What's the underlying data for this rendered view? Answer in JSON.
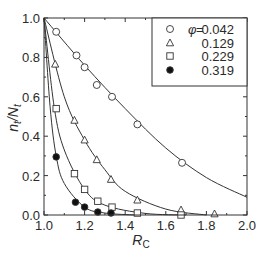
{
  "chart_data": {
    "type": "scatter",
    "title": "",
    "xlabel": "R_C",
    "xlabel_main": "R",
    "xlabel_sub": "C",
    "ylabel": "n_t/N_t",
    "ylabel_n": "n",
    "ylabel_sub1": "t",
    "ylabel_slash": "/N",
    "ylabel_sub2": "t",
    "xlim": [
      1.0,
      2.0
    ],
    "ylim": [
      0.0,
      1.0
    ],
    "x_ticks": [
      "1.0",
      "1.2",
      "1.4",
      "1.6",
      "1.8",
      "2.0"
    ],
    "x_tick_values": [
      1.0,
      1.2,
      1.4,
      1.6,
      1.8,
      2.0
    ],
    "y_ticks": [
      "0.0",
      "0.2",
      "0.4",
      "0.6",
      "0.8",
      "1.0"
    ],
    "y_tick_values": [
      0.0,
      0.2,
      0.4,
      0.6,
      0.8,
      1.0
    ],
    "grid": false,
    "legend_position": "upper right",
    "legend_symbol": "φ",
    "legend_equals": "=",
    "series": [
      {
        "name": "0.042",
        "label": "0.042",
        "marker": "open-circle",
        "x": [
          1.06,
          1.16,
          1.2,
          1.26,
          1.335,
          1.46,
          1.68
        ],
        "y": [
          0.93,
          0.81,
          0.75,
          0.66,
          0.6,
          0.46,
          0.265
        ],
        "fit_curve": {
          "x": [
            1.0,
            1.2,
            1.4,
            1.6,
            1.8,
            2.0
          ],
          "y": [
            1.0,
            0.76,
            0.54,
            0.34,
            0.19,
            0.09
          ]
        }
      },
      {
        "name": "0.129",
        "label": "0.129",
        "marker": "open-triangle",
        "x": [
          1.055,
          1.15,
          1.2,
          1.26,
          1.33,
          1.46,
          1.675,
          1.84
        ],
        "y": [
          0.765,
          0.48,
          0.38,
          0.28,
          0.18,
          0.075,
          0.025,
          0.005
        ],
        "fit_curve": {
          "x": [
            1.0,
            1.1,
            1.2,
            1.3,
            1.4,
            1.6,
            1.8
          ],
          "y": [
            1.0,
            0.6,
            0.38,
            0.23,
            0.12,
            0.03,
            0.0
          ]
        }
      },
      {
        "name": "0.229",
        "label": "0.229",
        "marker": "open-square",
        "x": [
          1.06,
          1.15,
          1.2,
          1.265,
          1.335,
          1.46,
          1.675
        ],
        "y": [
          0.54,
          0.21,
          0.13,
          0.07,
          0.04,
          0.01,
          0.0
        ],
        "fit_curve": {
          "x": [
            1.0,
            1.05,
            1.1,
            1.2,
            1.3,
            1.5,
            1.7
          ],
          "y": [
            1.0,
            0.55,
            0.33,
            0.13,
            0.05,
            0.008,
            0.0
          ]
        }
      },
      {
        "name": "0.319",
        "label": "0.319",
        "marker": "filled-circle",
        "x": [
          1.06,
          1.155,
          1.2,
          1.265,
          1.33
        ],
        "y": [
          0.295,
          0.065,
          0.04,
          0.015,
          0.01
        ],
        "fit_curve": {
          "x": [
            1.0,
            1.03,
            1.06,
            1.1,
            1.2,
            1.3,
            1.45
          ],
          "y": [
            1.0,
            0.55,
            0.3,
            0.16,
            0.04,
            0.01,
            0.0
          ]
        }
      }
    ]
  }
}
